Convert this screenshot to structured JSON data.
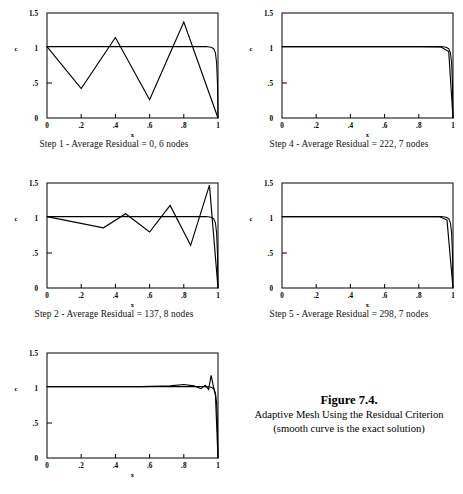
{
  "figure": {
    "number_label": "Figure 7.4.",
    "title_line": "Adaptive Mesh Using the Residual Criterion",
    "subtitle_line": "(smooth curve is the exact solution)"
  },
  "axes_common": {
    "xlabel": "x",
    "ylabel": "c",
    "xticks": [
      "0",
      ".2",
      ".4",
      ".6",
      ".8",
      "1"
    ],
    "xtick_values": [
      0,
      0.2,
      0.4,
      0.6,
      0.8,
      1
    ],
    "yticks": [
      "0",
      ".5",
      "1",
      "1.5"
    ],
    "ytick_values": [
      0,
      0.5,
      1,
      1.5
    ],
    "xlim": [
      0,
      1
    ],
    "ylim": [
      0,
      1.5
    ],
    "grid": false,
    "legend": "none"
  },
  "chart_data": [
    {
      "id": "step1",
      "type": "line",
      "title": "",
      "caption": "Step 1 - Average Residual = 0, 6 nodes",
      "step": 1,
      "average_residual": 0,
      "nodes": 6,
      "xlabel": "x",
      "ylabel": "c",
      "xlim": [
        0,
        1
      ],
      "ylim": [
        0,
        1.5
      ],
      "xticks": [
        0,
        0.2,
        0.4,
        0.6,
        0.8,
        1
      ],
      "yticks": [
        0,
        0.5,
        1,
        1.5
      ],
      "series": [
        {
          "name": "exact solution",
          "style": "smooth",
          "x": [
            0,
            0.1,
            0.2,
            0.3,
            0.4,
            0.5,
            0.6,
            0.7,
            0.8,
            0.88,
            0.93,
            0.96,
            0.975,
            0.985,
            0.992,
            0.997,
            1
          ],
          "y": [
            1.02,
            1.02,
            1.02,
            1.02,
            1.02,
            1.02,
            1.02,
            1.02,
            1.02,
            1.02,
            1.02,
            1.01,
            0.99,
            0.93,
            0.78,
            0.48,
            0.0
          ]
        },
        {
          "name": "adaptive mesh solution",
          "style": "piecewise-linear",
          "x": [
            0,
            0.2,
            0.4,
            0.6,
            0.8,
            1.0
          ],
          "y": [
            1.02,
            0.42,
            1.15,
            0.26,
            1.37,
            0.0
          ]
        }
      ]
    },
    {
      "id": "step4",
      "type": "line",
      "title": "",
      "caption": "Step 4 - Average Residual = 222, 7 nodes",
      "step": 4,
      "average_residual": 222,
      "nodes": 7,
      "xlabel": "x",
      "ylabel": "c",
      "xlim": [
        0,
        1
      ],
      "ylim": [
        0,
        1.5
      ],
      "xticks": [
        0,
        0.2,
        0.4,
        0.6,
        0.8,
        1
      ],
      "yticks": [
        0,
        0.5,
        1,
        1.5
      ],
      "series": [
        {
          "name": "exact solution",
          "style": "smooth",
          "x": [
            0,
            0.1,
            0.2,
            0.3,
            0.4,
            0.5,
            0.6,
            0.7,
            0.8,
            0.88,
            0.93,
            0.96,
            0.975,
            0.985,
            0.992,
            0.997,
            1
          ],
          "y": [
            1.02,
            1.02,
            1.02,
            1.02,
            1.02,
            1.02,
            1.02,
            1.02,
            1.02,
            1.02,
            1.02,
            1.01,
            0.99,
            0.93,
            0.78,
            0.48,
            0.0
          ]
        },
        {
          "name": "adaptive mesh solution",
          "style": "piecewise-linear",
          "x": [
            0,
            0.2,
            0.4,
            0.6,
            0.8,
            0.93,
            0.975,
            1.0
          ],
          "y": [
            1.02,
            1.02,
            1.02,
            1.02,
            1.02,
            1.015,
            0.95,
            0.0
          ]
        }
      ]
    },
    {
      "id": "step2",
      "type": "line",
      "title": "",
      "caption": "Step 2 - Average Residual = 137, 8 nodes",
      "step": 2,
      "average_residual": 137,
      "nodes": 8,
      "xlabel": "x",
      "ylabel": "c",
      "xlim": [
        0,
        1
      ],
      "ylim": [
        0,
        1.5
      ],
      "xticks": [
        0,
        0.2,
        0.4,
        0.6,
        0.8,
        1
      ],
      "yticks": [
        0,
        0.5,
        1,
        1.5
      ],
      "series": [
        {
          "name": "exact solution",
          "style": "smooth",
          "x": [
            0,
            0.1,
            0.2,
            0.3,
            0.4,
            0.5,
            0.6,
            0.7,
            0.8,
            0.88,
            0.93,
            0.96,
            0.975,
            0.985,
            0.992,
            0.997,
            1
          ],
          "y": [
            1.02,
            1.02,
            1.02,
            1.02,
            1.02,
            1.02,
            1.02,
            1.02,
            1.02,
            1.02,
            1.02,
            1.01,
            0.99,
            0.93,
            0.78,
            0.48,
            0.0
          ]
        },
        {
          "name": "adaptive mesh solution",
          "style": "piecewise-linear",
          "x": [
            0,
            0.33,
            0.46,
            0.6,
            0.72,
            0.84,
            0.95,
            1.0
          ],
          "y": [
            1.02,
            0.86,
            1.06,
            0.8,
            1.18,
            0.61,
            1.47,
            0.0
          ]
        }
      ]
    },
    {
      "id": "step5",
      "type": "line",
      "title": "",
      "caption": "Step 5 - Average Residual = 298, 7 nodes",
      "step": 5,
      "average_residual": 298,
      "nodes": 7,
      "xlabel": "x",
      "ylabel": "c",
      "xlim": [
        0,
        1
      ],
      "ylim": [
        0,
        1.5
      ],
      "xticks": [
        0,
        0.2,
        0.4,
        0.6,
        0.8,
        1
      ],
      "yticks": [
        0,
        0.5,
        1,
        1.5
      ],
      "series": [
        {
          "name": "exact solution",
          "style": "smooth",
          "x": [
            0,
            0.1,
            0.2,
            0.3,
            0.4,
            0.5,
            0.6,
            0.7,
            0.8,
            0.88,
            0.93,
            0.96,
            0.975,
            0.985,
            0.992,
            0.997,
            1
          ],
          "y": [
            1.02,
            1.02,
            1.02,
            1.02,
            1.02,
            1.02,
            1.02,
            1.02,
            1.02,
            1.02,
            1.02,
            1.01,
            0.99,
            0.93,
            0.78,
            0.48,
            0.0
          ]
        },
        {
          "name": "adaptive mesh solution",
          "style": "piecewise-linear",
          "x": [
            0,
            0.2,
            0.4,
            0.6,
            0.8,
            0.92,
            0.965,
            1.0
          ],
          "y": [
            1.02,
            1.02,
            1.02,
            1.02,
            1.02,
            1.02,
            0.97,
            0.0
          ]
        }
      ]
    },
    {
      "id": "step3",
      "type": "line",
      "title": "",
      "caption": "",
      "step": 3,
      "average_residual": null,
      "nodes": null,
      "xlabel": "x",
      "ylabel": "c",
      "xlim": [
        0,
        1
      ],
      "ylim": [
        0,
        1.5
      ],
      "xticks": [
        0,
        0.2,
        0.4,
        0.6,
        0.8,
        1
      ],
      "yticks": [
        0,
        0.5,
        1,
        1.5
      ],
      "series": [
        {
          "name": "exact solution",
          "style": "smooth",
          "x": [
            0,
            0.1,
            0.2,
            0.3,
            0.4,
            0.5,
            0.6,
            0.7,
            0.8,
            0.88,
            0.93,
            0.96,
            0.975,
            0.985,
            0.992,
            0.997,
            1
          ],
          "y": [
            1.02,
            1.02,
            1.02,
            1.02,
            1.02,
            1.02,
            1.02,
            1.02,
            1.02,
            1.02,
            1.02,
            1.01,
            0.99,
            0.93,
            0.78,
            0.48,
            0.0
          ]
        },
        {
          "name": "adaptive mesh solution",
          "style": "piecewise-linear",
          "x": [
            0,
            0.3,
            0.55,
            0.72,
            0.8,
            0.86,
            0.9,
            0.925,
            0.945,
            0.96,
            0.975,
            0.985,
            1.0
          ],
          "y": [
            1.02,
            1.02,
            1.02,
            1.03,
            1.05,
            1.03,
            0.99,
            1.04,
            0.98,
            1.18,
            1.0,
            0.9,
            0.0
          ]
        }
      ]
    }
  ],
  "panels": [
    {
      "id": "step1",
      "caption": "Step 1 - Average Residual = 0, 6 nodes"
    },
    {
      "id": "step4",
      "caption": "Step 4 - Average Residual = 222, 7 nodes"
    },
    {
      "id": "step2",
      "caption": "Step 2 - Average Residual = 137, 8 nodes"
    },
    {
      "id": "step5",
      "caption": "Step 5 - Average Residual = 298, 7 nodes"
    },
    {
      "id": "step3",
      "caption": ""
    }
  ],
  "colors": {
    "ink": "#000000",
    "paper": "#ffffff"
  }
}
